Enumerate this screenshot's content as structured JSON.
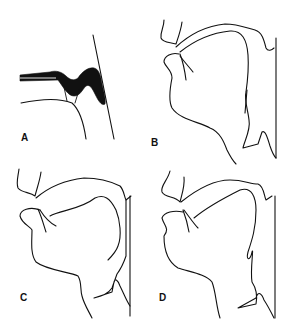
{
  "figure": {
    "panels": [
      {
        "id": "A",
        "label": "A",
        "description": "Tracing with black-filled soft palate outline against vertical pharyngeal wall line"
      },
      {
        "id": "B",
        "label": "B",
        "description": "Lateral vocal tract outline tracing"
      },
      {
        "id": "C",
        "label": "C",
        "description": "Lateral vocal tract outline tracing"
      },
      {
        "id": "D",
        "label": "D",
        "description": "Lateral vocal tract outline tracing"
      }
    ],
    "colors": {
      "ink": "#111111",
      "background": "#ffffff"
    }
  }
}
